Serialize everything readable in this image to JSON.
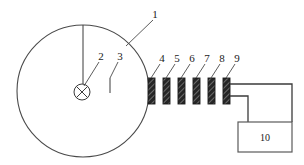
{
  "diagram": {
    "background_color": "#ffffff",
    "line_color": "#3b3b3b",
    "plate_fill_color": "#2b2b2b",
    "width": 304,
    "height": 165
  },
  "chamber": {
    "label": "1",
    "shape": "circle",
    "center_x": 83,
    "center_y": 91,
    "radius": 66
  },
  "source": {
    "label": "2",
    "symbol": "crossed-circle",
    "center_x": 82,
    "center_y": 92,
    "radius": 8
  },
  "pointer": {
    "label": "3",
    "tick_x": 110,
    "tick_top": 78,
    "tick_bottom": 93
  },
  "plates": [
    {
      "label": "4",
      "x": 148,
      "y": 78,
      "width": 7,
      "height": 26
    },
    {
      "label": "5",
      "x": 163,
      "y": 78,
      "width": 7,
      "height": 26
    },
    {
      "label": "6",
      "x": 178,
      "y": 78,
      "width": 7,
      "height": 26
    },
    {
      "label": "7",
      "x": 193,
      "y": 78,
      "width": 7,
      "height": 26
    },
    {
      "label": "8",
      "x": 208,
      "y": 78,
      "width": 7,
      "height": 26
    },
    {
      "label": "9",
      "x": 223,
      "y": 78,
      "width": 7,
      "height": 26
    }
  ],
  "instrument": {
    "label": "10",
    "x": 238,
    "y": 122,
    "width": 54,
    "height": 30
  },
  "callouts": {
    "c1": "1",
    "c2": "2",
    "c3": "3",
    "c4": "4",
    "c5": "5",
    "c6": "6",
    "c7": "7",
    "c8": "8",
    "c9": "9",
    "c10": "10"
  }
}
